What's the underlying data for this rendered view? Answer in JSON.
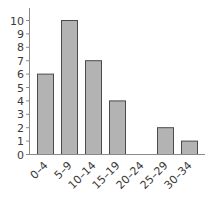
{
  "chart_data": {
    "type": "bar",
    "title": "",
    "xlabel": "",
    "ylabel": "",
    "categories": [
      "0–4",
      "5–9",
      "10–14",
      "15–19",
      "20–24",
      "25–29",
      "30–34"
    ],
    "values": [
      6,
      10,
      7,
      4,
      0,
      2,
      1
    ],
    "ylim": [
      0,
      10
    ],
    "yticks": [
      0,
      1,
      2,
      3,
      4,
      5,
      6,
      7,
      8,
      9,
      10
    ],
    "grid": false,
    "legend": null,
    "colors": {
      "bar_fill": "#b3b3b3",
      "bar_stroke": "#4a4a4a",
      "axis": "#8a8a8a",
      "text": "#3a3a3a"
    }
  }
}
